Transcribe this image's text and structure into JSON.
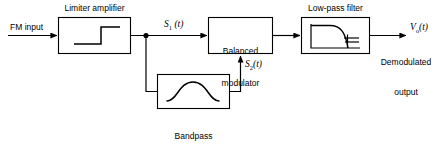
{
  "diagram": {
    "stroke_color": "#000000",
    "background": "#ffffff",
    "input": {
      "label": "FM input"
    },
    "output": {
      "signal_v": "V",
      "signal_sub": "o",
      "signal_paren": "(t)",
      "caption_line1": "Demodulated",
      "caption_line2": "output"
    },
    "blocks": [
      {
        "id": "limiter-amplifier",
        "caption": "Limiter amplifier",
        "icon": "step-function-icon"
      },
      {
        "id": "balanced-modulator",
        "text_line1": "Balanced",
        "text_line2": "modulator"
      },
      {
        "id": "low-pass-filter",
        "caption": "Low-pass filter",
        "icon": "lowpass-rolloff-icon"
      },
      {
        "id": "bandpass-phase-shift-network",
        "caption_line1": "Bandpass",
        "caption_line2": "phase-shift",
        "caption_line3": "network",
        "icon": "bandpass-bell-curve-icon"
      }
    ],
    "signals": [
      {
        "id": "s1",
        "base": "S",
        "sub": "1",
        "paren": " (t)"
      },
      {
        "id": "s2",
        "base": "S",
        "sub": "2",
        "paren": "(t)"
      }
    ]
  }
}
